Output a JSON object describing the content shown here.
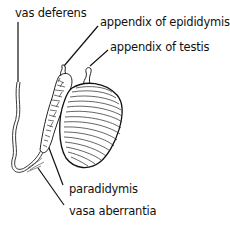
{
  "figure": {
    "labels": {
      "vas_deferens": "vas deferens",
      "appendix_of_epididymis": "appendix of epididymis",
      "appendix_of_testis": "appendix of testis",
      "paradidymis": "paradidymis",
      "vasa_aberrantia": "vasa aberrantia"
    }
  }
}
